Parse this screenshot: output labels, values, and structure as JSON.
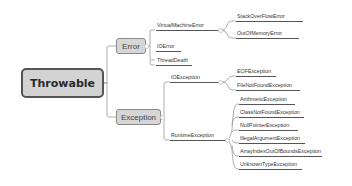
{
  "diagram": {
    "type": "mind-map",
    "root": {
      "label": "Throwable",
      "children": [
        {
          "label": "Error",
          "children": [
            {
              "label": "VirtualMachineError",
              "children": [
                {
                  "label": "StackOverFlowError"
                },
                {
                  "label": "OutOfMemoryError"
                }
              ]
            },
            {
              "label": "IOError"
            },
            {
              "label": "ThreadDeath"
            }
          ]
        },
        {
          "label": "Exception",
          "children": [
            {
              "label": "IOException",
              "children": [
                {
                  "label": "EOFException"
                },
                {
                  "label": "FileNotFoundException"
                }
              ]
            },
            {
              "label": "RuntimeException",
              "children": [
                {
                  "label": "ArithmeticException"
                },
                {
                  "label": "ClassNotFoundException"
                },
                {
                  "label": "NullPointerException"
                },
                {
                  "label": "IllegalArgumentException"
                },
                {
                  "label": "ArrayIndexOutOfBoundsException"
                },
                {
                  "label": "UnknownTypeException"
                }
              ]
            }
          ]
        }
      ]
    },
    "colors": {
      "root_fill": "#d3d3d3",
      "root_border": "#555555",
      "branch_fill": "#d6d6d6",
      "branch_border": "#8a8a8a",
      "line": "#8f8f8f",
      "leaf_underline": "#555555"
    }
  }
}
